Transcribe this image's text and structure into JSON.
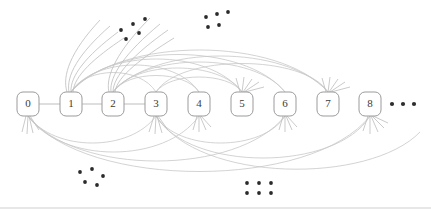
{
  "figure": {
    "title": "",
    "kind": "graph-diagram",
    "colors": {
      "background": "#ffffff",
      "node_stroke": "#9b9b9b",
      "node_fill": "#ffffff",
      "node_label": "#3a3a3a",
      "edge": "#b6b6b6",
      "edge_faint": "#c8c8c8",
      "whisker": "#c0c0c0",
      "dot": "#2e2e2e",
      "rule": "#cfcfcf"
    }
  },
  "nodes": [
    {
      "id": "node-0",
      "label": "0",
      "cx": 28,
      "cy": 104
    },
    {
      "id": "node-1",
      "label": "1",
      "cx": 71,
      "cy": 104
    },
    {
      "id": "node-2",
      "label": "2",
      "cx": 113,
      "cy": 104
    },
    {
      "id": "node-3",
      "label": "3",
      "cx": 156,
      "cy": 104
    },
    {
      "id": "node-4",
      "label": "4",
      "cx": 199,
      "cy": 104
    },
    {
      "id": "node-5",
      "label": "5",
      "cx": 242,
      "cy": 104
    },
    {
      "id": "node-6",
      "label": "6",
      "cx": 285,
      "cy": 104
    },
    {
      "id": "node-7",
      "label": "7",
      "cx": 328,
      "cy": 104
    },
    {
      "id": "node-8",
      "label": "8",
      "cx": 370,
      "cy": 104
    }
  ],
  "node_style": {
    "width": 22,
    "height": 24,
    "corner_radius": 6
  },
  "trailing_ellipsis": {
    "name": "trailing-ellipsis",
    "dots": [
      {
        "cx": 392,
        "cy": 104,
        "r": 2.1
      },
      {
        "cx": 403,
        "cy": 104,
        "r": 2.1
      },
      {
        "cx": 414,
        "cy": 104,
        "r": 2.1
      }
    ]
  },
  "dot_clusters": [
    {
      "name": "ellipsis-cluster-top-left",
      "dots": [
        {
          "cx": 121,
          "cy": 30,
          "r": 1.9
        },
        {
          "cx": 133,
          "cy": 24,
          "r": 1.9
        },
        {
          "cx": 145,
          "cy": 19,
          "r": 1.9
        },
        {
          "cx": 126,
          "cy": 39,
          "r": 1.9
        },
        {
          "cx": 139,
          "cy": 33,
          "r": 1.9
        }
      ]
    },
    {
      "name": "ellipsis-cluster-top-right",
      "dots": [
        {
          "cx": 206,
          "cy": 17,
          "r": 1.9
        },
        {
          "cx": 217,
          "cy": 14,
          "r": 1.9
        },
        {
          "cx": 228,
          "cy": 12,
          "r": 1.9
        },
        {
          "cx": 208,
          "cy": 27,
          "r": 1.9
        },
        {
          "cx": 219,
          "cy": 25,
          "r": 1.9
        }
      ]
    },
    {
      "name": "ellipsis-cluster-bottom-left",
      "dots": [
        {
          "cx": 80,
          "cy": 172,
          "r": 1.9
        },
        {
          "cx": 92,
          "cy": 169,
          "r": 1.9
        },
        {
          "cx": 103,
          "cy": 176,
          "r": 1.9
        },
        {
          "cx": 85,
          "cy": 182,
          "r": 1.9
        },
        {
          "cx": 97,
          "cy": 185,
          "r": 1.9
        }
      ]
    },
    {
      "name": "ellipsis-cluster-bottom-right",
      "dots": [
        {
          "cx": 247,
          "cy": 183,
          "r": 1.9
        },
        {
          "cx": 259,
          "cy": 183,
          "r": 1.9
        },
        {
          "cx": 271,
          "cy": 183,
          "r": 1.9
        },
        {
          "cx": 247,
          "cy": 193,
          "r": 1.9
        },
        {
          "cx": 259,
          "cy": 193,
          "r": 1.9
        },
        {
          "cx": 271,
          "cy": 193,
          "r": 1.9
        }
      ]
    }
  ],
  "chain_edges": [
    {
      "name": "edge-0-1",
      "d": "M 39 104 L 60 104"
    },
    {
      "name": "edge-1-2",
      "d": "M 82 104 L 102 104"
    },
    {
      "name": "edge-2-3",
      "d": "M 124 104 L 145 104"
    }
  ],
  "arc_edges_above": [
    {
      "name": "arc-1-3",
      "d": "M 71 92 C 86 66, 140 66, 156 92"
    },
    {
      "name": "arc-1-4",
      "d": "M 71 92 C 95 56, 175 56, 199 92"
    },
    {
      "name": "arc-1-5",
      "d": "M 71 92 C 105 48, 208 48, 242 92"
    },
    {
      "name": "arc-1-6",
      "d": "M 71 92 C 112 42, 244 42, 285 92"
    },
    {
      "name": "arc-1-7",
      "d": "M 71 92 C 120 36, 279 36, 328 92"
    },
    {
      "name": "arc-2-4",
      "d": "M 113 92 C 127 70, 185 70, 199 92"
    },
    {
      "name": "arc-2-5",
      "d": "M 113 92 C 135 60, 220 60, 242 92"
    },
    {
      "name": "arc-2-6",
      "d": "M 113 92 C 144 52, 254 52, 285 92"
    },
    {
      "name": "arc-2-7",
      "d": "M 113 92 C 155 44, 286 44, 328 92"
    },
    {
      "name": "arc-3-5",
      "d": "M 156 92 C 170 72, 228 72, 242 92"
    },
    {
      "name": "arc-3-7",
      "d": "M 156 92 C 180 54, 304 54, 328 92"
    }
  ],
  "arc_edges_below": [
    {
      "name": "arc-0-3-low",
      "d": "M 28 116 C 55 152, 130 152, 156 116"
    },
    {
      "name": "arc-0-4-low",
      "d": "M 28 116 C 62 164, 165 164, 199 116"
    },
    {
      "name": "arc-0-6-low",
      "d": "M 28 116 C 76 176, 237 176, 285 116"
    },
    {
      "name": "arc-0-8-low",
      "d": "M 28 116 C 86 190, 312 190, 370 116"
    },
    {
      "name": "arc-3-6-low",
      "d": "M 156 116 C 178 152, 263 152, 285 116"
    },
    {
      "name": "arc-3-8-low",
      "d": "M 156 116 C 190 172, 336 172, 370 116"
    },
    {
      "name": "arc-3-far-low",
      "d": "M 156 116 C 200 184, 370 184, 420 132"
    }
  ],
  "whisker_fans": [
    {
      "name": "whisker-fan-node-1-up",
      "strokes": [
        "M 67 92 C 62 76, 70 52, 100 20",
        "M 69 92 C 66 76, 78 54, 110 26",
        "M 71 92 C 70 76, 86 56, 118 32",
        "M 73 92 C 74 76, 94 58, 124 38"
      ]
    },
    {
      "name": "whisker-fan-node-2-up",
      "strokes": [
        "M 109 92 C 105 76, 118 50, 150 18",
        "M 111 92 C 109 76, 126 52, 160 24",
        "M 113 92 C 113 76, 134 54, 168 30",
        "M 115 92 C 117 76, 142 58, 174 38"
      ]
    },
    {
      "name": "whisker-fan-node-5-up",
      "strokes": [
        "M 240 92 L 236 78",
        "M 242 92 L 244 77",
        "M 243 92 L 252 79",
        "M 244 92 L 259 82",
        "M 245 92 L 264 87"
      ]
    },
    {
      "name": "whisker-fan-node-7-up",
      "strokes": [
        "M 326 92 L 322 78",
        "M 328 92 L 330 77",
        "M 329 92 L 338 79",
        "M 330 92 L 345 82",
        "M 331 92 L 350 87"
      ]
    },
    {
      "name": "whisker-fan-node-0-down",
      "strokes": [
        "M 26 116 L 22 132",
        "M 28 116 L 27 134",
        "M 29 116 L 33 133",
        "M 30 116 L 39 130"
      ]
    },
    {
      "name": "whisker-fan-node-3-down",
      "strokes": [
        "M 154 116 L 149 132",
        "M 156 116 L 155 134",
        "M 157 116 L 162 133",
        "M 158 116 L 168 130"
      ]
    },
    {
      "name": "whisker-fan-node-4-down",
      "strokes": [
        "M 197 116 L 193 130",
        "M 199 116 L 199 132",
        "M 200 116 L 206 130",
        "M 201 116 L 211 127"
      ]
    },
    {
      "name": "whisker-fan-node-6-down",
      "strokes": [
        "M 283 116 L 279 130",
        "M 285 116 L 285 132",
        "M 286 116 L 292 130",
        "M 287 116 L 297 127"
      ]
    },
    {
      "name": "whisker-fan-node-8-down",
      "strokes": [
        "M 368 116 L 363 131",
        "M 370 116 L 370 134",
        "M 371 116 L 378 132",
        "M 372 116 L 384 128",
        "M 373 116 L 388 123"
      ]
    }
  ],
  "rule": {
    "name": "bottom-rule",
    "d": "M 0 208 L 431 208"
  }
}
